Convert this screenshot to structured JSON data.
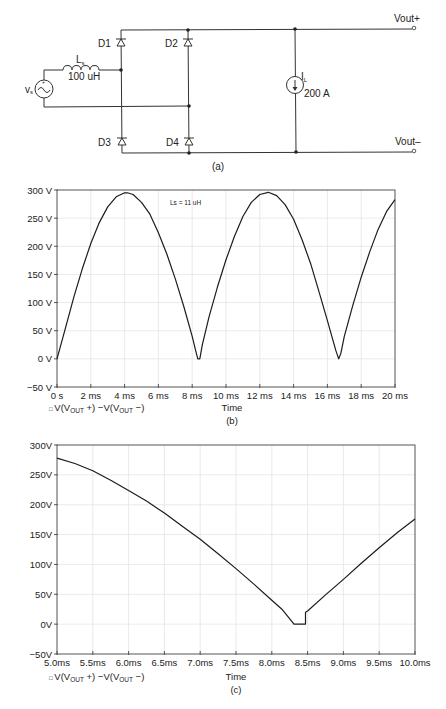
{
  "circuit": {
    "caption": "(a)",
    "source_label": "v",
    "source_sub": "s",
    "inductor_label": "L",
    "inductor_sub": "s",
    "inductor_value": "100 uH",
    "diodes": [
      "D1",
      "D2",
      "D3",
      "D4"
    ],
    "load_label": "I",
    "load_sub": "L",
    "load_value": "200 A",
    "vout_plus": "Vout+",
    "vout_minus": "Vout–"
  },
  "chart_data": [
    {
      "id": "b",
      "type": "line",
      "title": "",
      "caption": "(b)",
      "annotation": "Ls = 11 uH",
      "xlabel": "Time",
      "ylabel": "",
      "legend": "V(V_OUT +) −V(V_OUT −)",
      "xlim": [
        0,
        20
      ],
      "ylim": [
        -50,
        300
      ],
      "grid": true,
      "x_tick_labels": [
        "0 s",
        "2 ms",
        "4 ms",
        "6 ms",
        "8 ms",
        "10 ms",
        "12 ms",
        "14 ms",
        "16 ms",
        "18 ms",
        "20 ms"
      ],
      "y_tick_labels": [
        "300 V",
        "250 V",
        "200 V",
        "150 V",
        "100 V",
        "50 V",
        "0 V",
        "−50 V"
      ],
      "series": [
        {
          "name": "V(VOUT+) - V(VOUT-)",
          "x_ms": [
            0,
            0.5,
            1,
            1.5,
            2,
            2.5,
            3,
            3.5,
            4,
            4.17,
            4.5,
            5,
            5.5,
            6,
            6.5,
            7,
            7.5,
            8,
            8.2,
            8.33,
            8.45,
            8.6,
            9,
            9.5,
            10,
            10.5,
            11,
            11.5,
            12,
            12.5,
            13,
            13.5,
            14,
            14.5,
            15,
            15.5,
            16,
            16.5,
            16.67,
            16.8,
            17,
            17.5,
            18,
            18.5,
            19,
            19.5,
            20
          ],
          "values": [
            0,
            55,
            110,
            160,
            205,
            242,
            270,
            288,
            295,
            295,
            292,
            278,
            257,
            224,
            186,
            142,
            93,
            40,
            15,
            0,
            0,
            25,
            75,
            128,
            176,
            218,
            253,
            278,
            292,
            296,
            290,
            274,
            248,
            212,
            170,
            120,
            68,
            15,
            0,
            10,
            40,
            95,
            145,
            190,
            230,
            262,
            283
          ]
        }
      ]
    },
    {
      "id": "c",
      "type": "line",
      "title": "",
      "caption": "(c)",
      "xlabel": "Time",
      "ylabel": "",
      "legend": "V(V_OUT +) −V(V_OUT −)",
      "xlim": [
        5,
        10
      ],
      "ylim": [
        -50,
        300
      ],
      "grid": true,
      "x_tick_labels": [
        "5.0ms",
        "5.5ms",
        "6.0ms",
        "6.5ms",
        "7.0ms",
        "7.5ms",
        "8.0ms",
        "8.5ms",
        "9.0ms",
        "9.5ms",
        "10.0ms"
      ],
      "y_tick_labels": [
        "300V",
        "250V",
        "200V",
        "150V",
        "100V",
        "50V",
        "0V",
        "−50V"
      ],
      "series": [
        {
          "name": "V(VOUT+) - V(VOUT-)",
          "x_ms": [
            5.0,
            5.25,
            5.5,
            5.75,
            6.0,
            6.25,
            6.5,
            6.75,
            7.0,
            7.25,
            7.5,
            7.75,
            8.0,
            8.15,
            8.31,
            8.47,
            8.47,
            8.5,
            8.75,
            9.0,
            9.25,
            9.5,
            9.75,
            10.0
          ],
          "values": [
            278,
            269,
            257,
            241,
            224,
            206,
            186,
            164,
            142,
            118,
            93,
            67,
            40,
            24,
            0,
            0,
            20,
            22,
            49,
            75,
            102,
            128,
            153,
            176
          ]
        }
      ]
    }
  ],
  "legend_marker": "□",
  "legend_prefix": "V(V",
  "legend_sub1": "OUT",
  "legend_mid": " +) −V(V",
  "legend_sub2": "OUT",
  "legend_end": " −)"
}
